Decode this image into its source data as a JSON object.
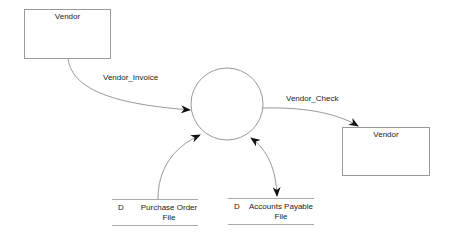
{
  "diagram": {
    "type": "data-flow-diagram",
    "entities": [
      {
        "id": "vendor_1",
        "label": "Vendor"
      },
      {
        "id": "vendor_2",
        "label": "Vendor"
      }
    ],
    "process": {
      "id": "process",
      "label": ""
    },
    "stores": [
      {
        "prefix": "D",
        "line1": "Purchase Order",
        "line2": "File"
      },
      {
        "prefix": "D",
        "line1": "Accounts Payable",
        "line2": "File"
      }
    ],
    "flows": [
      {
        "label": "Vendor_Invoice",
        "from": "vendor_1",
        "to": "process"
      },
      {
        "label": "Vendor_Check",
        "from": "process",
        "to": "vendor_2"
      },
      {
        "label": "",
        "from": "store_purchase_order",
        "to": "process"
      },
      {
        "label": "",
        "from": "process",
        "to": "store_accounts_payable",
        "bidirectional": true
      }
    ],
    "colors": {
      "line": "#999999",
      "arrow": "#111111",
      "text": "#222222"
    }
  }
}
